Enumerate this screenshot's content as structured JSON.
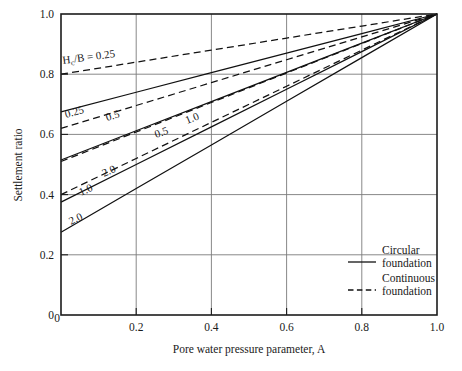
{
  "chart_data": {
    "type": "line",
    "title": "",
    "xlabel": "Pore water pressure parameter, A",
    "ylabel": "Settlement ratio",
    "xlim": [
      0,
      1.0
    ],
    "ylim": [
      0,
      1.0
    ],
    "xticks": [
      "0",
      "0.2",
      "0.4",
      "0.6",
      "0.8",
      "1.0"
    ],
    "xtick_values": [
      0,
      0.2,
      0.4,
      0.6,
      0.8,
      1.0
    ],
    "yticks": [
      "0",
      "0.2",
      "0.4",
      "0.6",
      "0.8",
      "1.0"
    ],
    "ytick_values": [
      0,
      0.2,
      0.4,
      0.6,
      0.8,
      1.0
    ],
    "grid": true,
    "legend_position": "lower-right",
    "convergence_point": [
      1.0,
      1.0
    ],
    "annotation": "H_c/B = 0.25",
    "annotation_parts": {
      "base": "H",
      "sub": "c",
      "rest": "/B = 0.25"
    },
    "series": [
      {
        "name": "Continuous Hc/B = 0.25",
        "style": "dashed",
        "label": "",
        "x": [
          0,
          0.2,
          0.4,
          0.6,
          0.8,
          1.0
        ],
        "values": [
          0.8,
          0.84,
          0.88,
          0.92,
          0.96,
          1.0
        ]
      },
      {
        "name": "Circular Hc/B = 0.25",
        "style": "solid",
        "label": "0.25",
        "x": [
          0,
          0.2,
          0.4,
          0.6,
          0.8,
          1.0
        ],
        "values": [
          0.675,
          0.74,
          0.805,
          0.87,
          0.935,
          1.0
        ]
      },
      {
        "name": "Continuous Hc/B = 0.5",
        "style": "dashed",
        "label": "0.5",
        "x": [
          0,
          0.2,
          0.4,
          0.6,
          0.8,
          1.0
        ],
        "values": [
          0.62,
          0.696,
          0.772,
          0.848,
          0.924,
          1.0
        ]
      },
      {
        "name": "Circular Hc/B = 0.5",
        "style": "solid",
        "label": "0.5",
        "x": [
          0,
          0.2,
          0.4,
          0.6,
          0.8,
          1.0
        ],
        "values": [
          0.515,
          0.612,
          0.709,
          0.806,
          0.903,
          1.0
        ]
      },
      {
        "name": "Continuous Hc/B = 1.0",
        "style": "dashed",
        "label": "1.0",
        "x": [
          0,
          0.2,
          0.4,
          0.6,
          0.8,
          1.0
        ],
        "values": [
          0.51,
          0.608,
          0.706,
          0.804,
          0.902,
          1.0
        ]
      },
      {
        "name": "Circular Hc/B = 1.0",
        "style": "solid",
        "label": "1.0",
        "x": [
          0,
          0.2,
          0.4,
          0.6,
          0.8,
          1.0
        ],
        "values": [
          0.375,
          0.5,
          0.625,
          0.75,
          0.875,
          1.0
        ]
      },
      {
        "name": "Continuous Hc/B = 2.0",
        "style": "dashed",
        "label": "2.0",
        "x": [
          0,
          0.2,
          0.4,
          0.6,
          0.8,
          1.0
        ],
        "values": [
          0.4,
          0.52,
          0.64,
          0.76,
          0.88,
          1.0
        ]
      },
      {
        "name": "Circular Hc/B = 2.0",
        "style": "solid",
        "label": "2.0",
        "x": [
          0,
          0.2,
          0.4,
          0.6,
          0.8,
          1.0
        ],
        "values": [
          0.275,
          0.42,
          0.565,
          0.71,
          0.855,
          1.0
        ]
      }
    ],
    "legend": [
      {
        "style": "solid",
        "line1": "Circular",
        "line2": "foundation"
      },
      {
        "style": "dashed",
        "line1": "Continuous",
        "line2": "foundation"
      }
    ]
  }
}
